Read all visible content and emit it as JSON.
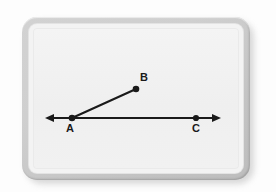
{
  "scene": {
    "type": "geometry-figure",
    "background_color": "#fdfdfd",
    "bezel_color": "#c9c9c9",
    "panel_color": "#f1f1f1",
    "ink_color": "#1a1a1a"
  },
  "figure": {
    "title": "",
    "points": [
      {
        "id": "A",
        "label": "A",
        "x": 39,
        "y": 90,
        "label_x": 37,
        "label_y": 102,
        "dot": true
      },
      {
        "id": "B",
        "label": "B",
        "x": 103,
        "y": 61,
        "label_x": 110,
        "label_y": 54,
        "dot": true
      },
      {
        "id": "C",
        "label": "C",
        "x": 163,
        "y": 90,
        "label_x": 163,
        "label_y": 102,
        "dot": true
      }
    ],
    "segments": [
      {
        "id": "AB",
        "from": "A",
        "to": "B",
        "style": "segment"
      }
    ],
    "lines": [
      {
        "id": "line-AC",
        "from": "A",
        "to": "C",
        "style": "double-arrow",
        "x1": 12,
        "y1": 90,
        "x2": 188,
        "y2": 90
      }
    ],
    "line_width": 2,
    "dot_radius": 3.2,
    "arrow_size": 6
  },
  "labels": {
    "a": "A",
    "b": "B",
    "c": "C"
  }
}
